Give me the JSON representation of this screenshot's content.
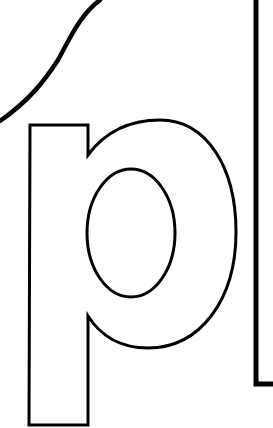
{
  "artwork": {
    "letter": "p",
    "style": "outline",
    "stroke_color": "#000000",
    "background_color": "#ffffff"
  }
}
